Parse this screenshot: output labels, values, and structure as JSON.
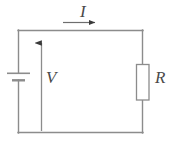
{
  "figure": {
    "type": "circuit-diagram",
    "background_color": "#ffffff",
    "line_color": "#8c8c8c",
    "arrow_color": "#4a4a4a",
    "label_color": "#4a4a4a"
  },
  "labels": {
    "current": "I",
    "voltage": "V",
    "resistance": "R"
  },
  "components": [
    {
      "name": "battery",
      "symbol": "battery-cell",
      "position": "left-branch",
      "long_plate_y": 73,
      "short_plate_y": 80
    },
    {
      "name": "resistor",
      "symbol": "resistor-box",
      "position": "right-branch",
      "label": "R"
    },
    {
      "name": "current-arrow",
      "symbol": "arrow-right",
      "position": "top-branch",
      "label": "I",
      "direction": "right"
    },
    {
      "name": "voltage-arrow",
      "symbol": "arrow-up",
      "position": "interior-vertical",
      "label": "V",
      "direction": "up"
    }
  ],
  "loop": {
    "left_x": 18,
    "right_x": 143,
    "top_y": 30,
    "bottom_y": 133
  }
}
